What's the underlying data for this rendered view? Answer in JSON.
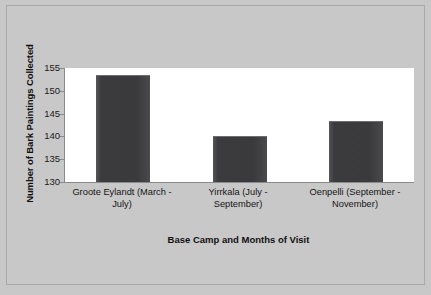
{
  "chart_data": {
    "type": "bar",
    "title": "",
    "categories": [
      "Groote Eylandt (March - July)",
      "Yirrkala (July - September)",
      "Oenpelli (September - November)"
    ],
    "category_lines": [
      [
        "Groote Eylandt (March -",
        "July)"
      ],
      [
        "Yirrkala (July -",
        "September)"
      ],
      [
        "Oenpelli (September -",
        "November)"
      ]
    ],
    "values": [
      153.5,
      140.1,
      143.3
    ],
    "xlabel": "Base Camp and Months of Visit",
    "ylabel": "Number of Bark Paintings Collected",
    "ylim": [
      130,
      155
    ],
    "yticks": [
      130,
      135,
      140,
      145,
      150,
      155
    ],
    "ytick_labels": [
      "130",
      "135",
      "140",
      "145",
      "150",
      "155"
    ],
    "grid": false,
    "legend": false,
    "bar_color": "#3a3a3c",
    "plot_background": "#ffffff",
    "figure_background": "#c8c8c8"
  }
}
